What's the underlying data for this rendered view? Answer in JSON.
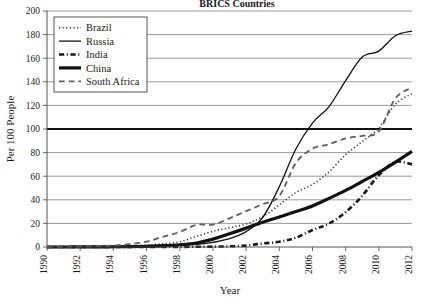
{
  "chart_data": {
    "type": "line",
    "title": "BRICS Countries",
    "xlabel": "Year",
    "ylabel": "Per 100 People",
    "xlim": [
      1990,
      2012
    ],
    "ylim": [
      0,
      200
    ],
    "grid": true,
    "emphasized_gridline": 100,
    "legend_position": "top-left",
    "xticks": [
      1990,
      1992,
      1994,
      1996,
      1998,
      2000,
      2002,
      2004,
      2006,
      2008,
      2010,
      2012
    ],
    "yticks": [
      0,
      20,
      40,
      60,
      80,
      100,
      120,
      140,
      160,
      180,
      200
    ],
    "x": [
      1990,
      1991,
      1992,
      1993,
      1994,
      1995,
      1996,
      1997,
      1998,
      1999,
      2000,
      2001,
      2002,
      2003,
      2004,
      2005,
      2006,
      2007,
      2008,
      2009,
      2010,
      2011,
      2012
    ],
    "series": [
      {
        "name": "Brazil",
        "style": "dotted",
        "color": "#3a3a3a",
        "width": 1.6,
        "values": [
          0,
          0.1,
          0.2,
          0.4,
          0.7,
          1.1,
          1.6,
          2.8,
          4.4,
          8.9,
          13.3,
          16.3,
          19.5,
          25.7,
          35.6,
          46.1,
          53.0,
          63.7,
          78.2,
          89.4,
          101.0,
          121.0,
          130.0
        ]
      },
      {
        "name": "Russia",
        "style": "solid-thin",
        "color": "#111111",
        "width": 1.3,
        "values": [
          0,
          0,
          0.1,
          0.1,
          0.2,
          0.3,
          0.6,
          1.0,
          1.5,
          2.2,
          4.0,
          7.0,
          13.0,
          25.0,
          51.0,
          83.0,
          105.0,
          119.0,
          141.0,
          161.0,
          166.0,
          179.0,
          183.0
        ]
      },
      {
        "name": "India",
        "style": "dashdot",
        "color": "#1a1a1a",
        "width": 2.6,
        "values": [
          0,
          0,
          0,
          0,
          0,
          0.01,
          0.03,
          0.06,
          0.1,
          0.2,
          0.3,
          0.6,
          1.2,
          3.0,
          4.4,
          7.9,
          14.4,
          19.9,
          29.4,
          43.4,
          60.9,
          72.0,
          70.0
        ]
      },
      {
        "name": "China",
        "style": "solid-thick",
        "color": "#111111",
        "width": 3.2,
        "values": [
          0,
          0,
          0.05,
          0.1,
          0.2,
          0.3,
          0.6,
          1.1,
          1.9,
          3.4,
          6.7,
          11.2,
          16.0,
          21.0,
          25.5,
          30.0,
          34.8,
          41.2,
          48.0,
          55.5,
          63.2,
          72.0,
          81.0
        ]
      },
      {
        "name": "South Africa",
        "style": "dashed",
        "color": "#5e5e5e",
        "width": 1.8,
        "values": [
          0,
          0.2,
          0.4,
          0.7,
          1.2,
          2.5,
          4.5,
          8.8,
          12.7,
          18.8,
          19.0,
          24.3,
          30.4,
          36.3,
          43.1,
          71.2,
          83.3,
          87.1,
          92.0,
          94.2,
          98.0,
          126.0,
          135.0
        ]
      }
    ]
  },
  "legend": {
    "items": [
      {
        "label": "Brazil"
      },
      {
        "label": "Russia"
      },
      {
        "label": "India"
      },
      {
        "label": "China"
      },
      {
        "label": "South Africa"
      }
    ]
  },
  "axis": {
    "y_title": "Per 100 People",
    "x_title": "Year"
  }
}
